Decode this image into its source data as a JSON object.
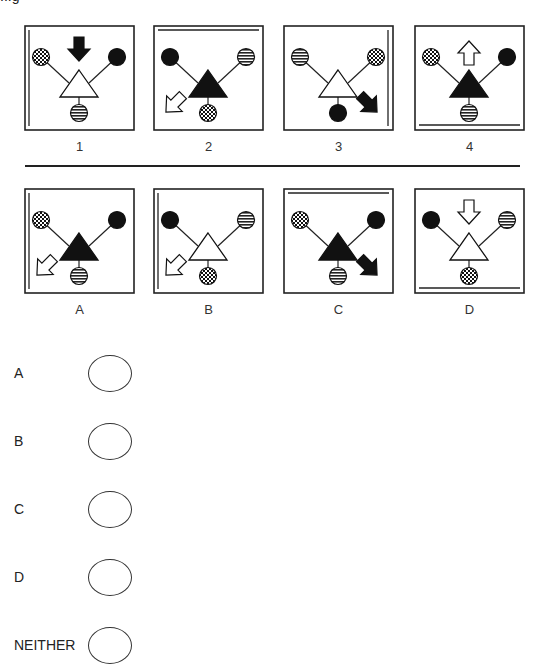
{
  "question_stub": "...g",
  "top_row": {
    "panels": [
      {
        "label": "1",
        "triangle": "white",
        "left_circle": "checker",
        "right_circle": "black",
        "bottom_circle": "striped",
        "arrow": {
          "position": "top",
          "direction": "down",
          "fill": "black"
        },
        "edge_line": "left"
      },
      {
        "label": "2",
        "triangle": "black",
        "left_circle": "black",
        "right_circle": "striped",
        "bottom_circle": "checker",
        "arrow": {
          "position": "bottom-left",
          "direction": "down-left",
          "fill": "white"
        },
        "edge_line": "top"
      },
      {
        "label": "3",
        "triangle": "white",
        "left_circle": "striped",
        "right_circle": "checker",
        "bottom_circle": "black",
        "arrow": {
          "position": "bottom-right",
          "direction": "down-right",
          "fill": "black"
        },
        "edge_line": "right"
      },
      {
        "label": "4",
        "triangle": "black",
        "left_circle": "checker",
        "right_circle": "black",
        "bottom_circle": "striped",
        "arrow": {
          "position": "top",
          "direction": "up",
          "fill": "white"
        },
        "edge_line": "bottom"
      }
    ]
  },
  "bottom_row": {
    "panels": [
      {
        "label": "A",
        "triangle": "black",
        "left_circle": "checker",
        "right_circle": "black",
        "bottom_circle": "striped",
        "arrow": {
          "position": "bottom-left",
          "direction": "down-left",
          "fill": "white"
        },
        "edge_line": "left"
      },
      {
        "label": "B",
        "triangle": "white",
        "left_circle": "black",
        "right_circle": "striped",
        "bottom_circle": "checker",
        "arrow": {
          "position": "bottom-left",
          "direction": "down-left",
          "fill": "white"
        },
        "edge_line": "left"
      },
      {
        "label": "C",
        "triangle": "black",
        "left_circle": "checker",
        "right_circle": "black",
        "bottom_circle": "striped",
        "arrow": {
          "position": "bottom-right",
          "direction": "down-right",
          "fill": "black"
        },
        "edge_line": "top"
      },
      {
        "label": "D",
        "triangle": "white",
        "left_circle": "black",
        "right_circle": "striped",
        "bottom_circle": "checker",
        "arrow": {
          "position": "top",
          "direction": "down",
          "fill": "white"
        },
        "edge_line": "bottom"
      }
    ]
  },
  "answers": {
    "options": [
      {
        "label": "A"
      },
      {
        "label": "B"
      },
      {
        "label": "C"
      },
      {
        "label": "D"
      },
      {
        "label": "NEITHER"
      }
    ]
  },
  "colors": {
    "ink": "#111111",
    "background": "#ffffff"
  }
}
